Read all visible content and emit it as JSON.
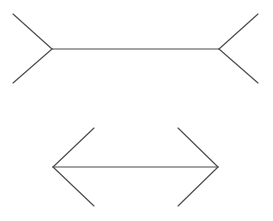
{
  "figure": {
    "name": "Müller-Lyer illusion",
    "type": "line-drawing",
    "background_color": "#ffffff",
    "stroke_color": "#4a4a4a",
    "stroke_width": 1.15,
    "canvas": {
      "width": 273,
      "height": 221
    },
    "shapes": [
      {
        "id": "top-figure",
        "label": "outward-fins figure",
        "fin_direction": "outward",
        "shaft": {
          "x1": 52,
          "y1": 49,
          "x2": 219,
          "y2": 49,
          "length": 167
        },
        "fins": [
          {
            "id": "top-left-upper-fin",
            "x1": 52,
            "y1": 49,
            "x2": 13,
            "y2": 14
          },
          {
            "id": "top-left-lower-fin",
            "x1": 52,
            "y1": 49,
            "x2": 13,
            "y2": 83
          },
          {
            "id": "top-right-upper-fin",
            "x1": 219,
            "y1": 49,
            "x2": 258,
            "y2": 14
          },
          {
            "id": "top-right-lower-fin",
            "x1": 219,
            "y1": 49,
            "x2": 258,
            "y2": 83
          }
        ]
      },
      {
        "id": "bottom-figure",
        "label": "inward-arrowheads figure",
        "fin_direction": "inward",
        "shaft": {
          "x1": 53,
          "y1": 167,
          "x2": 218,
          "y2": 167,
          "length": 165
        },
        "fins": [
          {
            "id": "bottom-left-upper-fin",
            "x1": 53,
            "y1": 167,
            "x2": 94,
            "y2": 128
          },
          {
            "id": "bottom-left-lower-fin",
            "x1": 53,
            "y1": 167,
            "x2": 94,
            "y2": 206
          },
          {
            "id": "bottom-right-upper-fin",
            "x1": 218,
            "y1": 167,
            "x2": 178,
            "y2": 128
          },
          {
            "id": "bottom-right-lower-fin",
            "x1": 218,
            "y1": 167,
            "x2": 178,
            "y2": 206
          }
        ]
      }
    ]
  }
}
